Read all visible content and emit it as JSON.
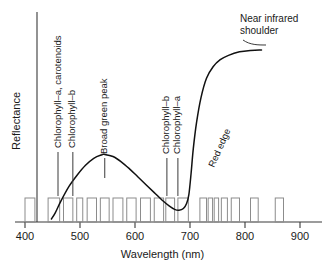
{
  "figure": {
    "background_color": "#ffffff",
    "axis_color": "#3a3a3a",
    "curve_color": "#111111",
    "band_color": "#8c8c8c",
    "text_color": "#1a1a1a"
  },
  "axes": {
    "x_title": "Wavelength (nm)",
    "y_title": "Reflectance",
    "x_ticks": [
      "400",
      "500",
      "600",
      "700",
      "800",
      "900"
    ],
    "x_tick_values": [
      400,
      500,
      600,
      700,
      800,
      900
    ]
  },
  "annotations": [
    {
      "id": "chl-a-carotenoids",
      "label": "Chlorophyll–a, carotenoids",
      "wavelength": 460,
      "orientation": "vertical"
    },
    {
      "id": "chl-b-blue",
      "label": "Chlorophyll–b",
      "wavelength": 487,
      "orientation": "vertical"
    },
    {
      "id": "broad-green-peak",
      "label": "Broad green peak",
      "wavelength": 545,
      "orientation": "vertical"
    },
    {
      "id": "chl-b-red",
      "label": "Chlorophyll–b",
      "wavelength": 658,
      "orientation": "vertical"
    },
    {
      "id": "chl-a-red",
      "label": "Chlorophyll–a",
      "wavelength": 678,
      "orientation": "vertical"
    },
    {
      "id": "red-edge",
      "label": "Red edge",
      "wavelength": 710,
      "orientation": "diagonal"
    },
    {
      "id": "near-infrared-shoulder",
      "label_line1": "Near infrared",
      "label_line2": "shoulder",
      "wavelength": 840,
      "orientation": "horizontal"
    }
  ],
  "chart_data": {
    "type": "line",
    "title": "",
    "xlabel": "Wavelength (nm)",
    "ylabel": "Reflectance",
    "xlim": [
      400,
      900
    ],
    "ylim": [
      0,
      1
    ],
    "grid": false,
    "legend_position": "none",
    "series": [
      {
        "name": "Vegetation spectral reflectance",
        "x": [
          448,
          455,
          465,
          480,
          495,
          510,
          525,
          540,
          545,
          560,
          575,
          590,
          605,
          620,
          635,
          650,
          662,
          672,
          680,
          688,
          694,
          698,
          702,
          706,
          712,
          720,
          730,
          742,
          755,
          770,
          790,
          810,
          830
        ],
        "y": [
          0.0,
          0.035,
          0.1,
          0.185,
          0.25,
          0.305,
          0.345,
          0.365,
          0.367,
          0.355,
          0.325,
          0.285,
          0.24,
          0.195,
          0.15,
          0.105,
          0.075,
          0.055,
          0.05,
          0.06,
          0.09,
          0.14,
          0.26,
          0.4,
          0.55,
          0.69,
          0.8,
          0.865,
          0.905,
          0.93,
          0.95,
          0.958,
          0.96
        ]
      }
    ],
    "annotation_markers": [
      {
        "label": "Chlorophyll–a, carotenoids",
        "x": 460,
        "note": "blue absorption"
      },
      {
        "label": "Chlorophyll–b",
        "x": 487,
        "note": "blue absorption"
      },
      {
        "label": "Broad green peak",
        "x": 545,
        "note": "green reflectance maximum"
      },
      {
        "label": "Chlorophyll–b",
        "x": 658,
        "note": "red absorption"
      },
      {
        "label": "Chlorophyll–a",
        "x": 678,
        "note": "red absorption"
      },
      {
        "label": "Red edge",
        "x": 710,
        "note": "steep rise"
      },
      {
        "label": "Near infrared shoulder",
        "x": 840,
        "note": "NIR plateau"
      }
    ],
    "spectral_bands": [
      {
        "start": 400,
        "end": 418
      },
      {
        "start": 442,
        "end": 463
      },
      {
        "start": 470,
        "end": 487
      },
      {
        "start": 494,
        "end": 505
      },
      {
        "start": 513,
        "end": 530
      },
      {
        "start": 537,
        "end": 553
      },
      {
        "start": 560,
        "end": 578
      },
      {
        "start": 585,
        "end": 602
      },
      {
        "start": 610,
        "end": 628
      },
      {
        "start": 635,
        "end": 652
      },
      {
        "start": 656,
        "end": 672
      },
      {
        "start": 678,
        "end": 697
      },
      {
        "start": 718,
        "end": 730
      },
      {
        "start": 733,
        "end": 741
      },
      {
        "start": 744,
        "end": 752
      },
      {
        "start": 757,
        "end": 768
      },
      {
        "start": 775,
        "end": 790
      },
      {
        "start": 810,
        "end": 824
      },
      {
        "start": 855,
        "end": 870
      }
    ]
  }
}
